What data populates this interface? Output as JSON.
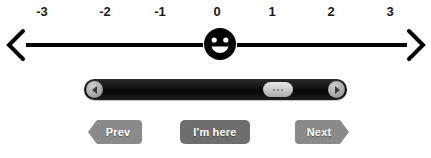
{
  "numberline": {
    "name": "relative-position-number-line",
    "tick_labels": [
      "-3",
      "-2",
      "-1",
      "0",
      "1",
      "2",
      "3"
    ],
    "tick_positions_px": [
      42,
      105,
      160,
      217,
      272,
      331,
      390
    ],
    "left_arrow_icon": "arrow-left-icon",
    "right_arrow_icon": "arrow-right-icon",
    "marker_icon": "smiley-face-icon",
    "marker_value": "0",
    "line_color": "#000000"
  },
  "scrollbar": {
    "name": "horizontal-scrollbar",
    "left_button_icon": "triangle-left-icon",
    "right_button_icon": "triangle-right-icon",
    "thumb_icon": "grip-dots-icon",
    "thumb_position_percent": 68,
    "track_color": "#111111",
    "thumb_color": "#cbcbcb"
  },
  "buttons": {
    "prev": {
      "label": "Prev",
      "color": "#8a8a8a"
    },
    "here": {
      "label": "I'm here",
      "color": "#6e6e6e"
    },
    "next": {
      "label": "Next",
      "color": "#8a8a8a"
    }
  }
}
